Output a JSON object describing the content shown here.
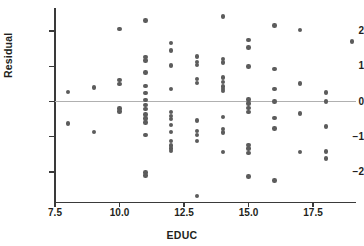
{
  "chart_data": {
    "type": "scatter",
    "title": "",
    "xlabel": "EDUC",
    "ylabel": "Residual",
    "xlim": [
      7.0,
      19.6
    ],
    "ylim": [
      -2.75,
      2.55
    ],
    "xticks": [
      7.5,
      10.0,
      12.5,
      15.0,
      17.5
    ],
    "xtick_labels": [
      "7.5",
      "10.0",
      "12.5",
      "15.0",
      "17.5"
    ],
    "yticks": [
      2,
      1,
      0,
      -1,
      -2
    ],
    "ytick_labels": [
      "2",
      "1",
      "0",
      "−1",
      "−2"
    ],
    "grid": false,
    "legend": null,
    "reference_line": {
      "type": "horizontal",
      "y": 0,
      "color": "#b0b0b0"
    },
    "marker": {
      "shape": "circle",
      "color": "#5c5c5c",
      "size": 4.4
    },
    "points": [
      {
        "x": 8,
        "y": 0.27
      },
      {
        "x": 8,
        "y": -0.63
      },
      {
        "x": 9,
        "y": 0.4
      },
      {
        "x": 9,
        "y": -0.86
      },
      {
        "x": 10,
        "y": 2.06
      },
      {
        "x": 10,
        "y": 0.61
      },
      {
        "x": 10,
        "y": 0.5
      },
      {
        "x": 10,
        "y": -0.2
      },
      {
        "x": 10,
        "y": -0.28
      },
      {
        "x": 11,
        "y": 2.3
      },
      {
        "x": 11,
        "y": 1.26
      },
      {
        "x": 11,
        "y": 1.16
      },
      {
        "x": 11,
        "y": 0.82
      },
      {
        "x": 11,
        "y": 0.44
      },
      {
        "x": 11,
        "y": 0.25
      },
      {
        "x": 11,
        "y": 0.05
      },
      {
        "x": 11,
        "y": -0.1
      },
      {
        "x": 11,
        "y": -0.22
      },
      {
        "x": 11,
        "y": -0.37
      },
      {
        "x": 11,
        "y": -0.48
      },
      {
        "x": 11,
        "y": -0.6
      },
      {
        "x": 11,
        "y": -0.95
      },
      {
        "x": 11,
        "y": -2.02
      },
      {
        "x": 11,
        "y": -2.1
      },
      {
        "x": 12,
        "y": 1.66
      },
      {
        "x": 12,
        "y": 1.45
      },
      {
        "x": 12,
        "y": 1.02
      },
      {
        "x": 12,
        "y": 0.35
      },
      {
        "x": 12,
        "y": -0.3
      },
      {
        "x": 12,
        "y": -0.42
      },
      {
        "x": 12,
        "y": -0.49
      },
      {
        "x": 12,
        "y": -0.67
      },
      {
        "x": 12,
        "y": -0.87
      },
      {
        "x": 12,
        "y": -1.12
      },
      {
        "x": 12,
        "y": -1.25
      },
      {
        "x": 12,
        "y": -1.33
      },
      {
        "x": 12,
        "y": -1.4
      },
      {
        "x": 13,
        "y": 1.28
      },
      {
        "x": 13,
        "y": 1.12
      },
      {
        "x": 13,
        "y": 1.03
      },
      {
        "x": 13,
        "y": 0.64
      },
      {
        "x": 13,
        "y": 0.53
      },
      {
        "x": 13,
        "y": -0.54
      },
      {
        "x": 13,
        "y": -0.84
      },
      {
        "x": 13,
        "y": -0.95
      },
      {
        "x": 13,
        "y": -1.12
      },
      {
        "x": 13,
        "y": -2.68
      },
      {
        "x": 14,
        "y": 2.42
      },
      {
        "x": 14,
        "y": 1.2
      },
      {
        "x": 14,
        "y": 1.11
      },
      {
        "x": 14,
        "y": 0.68
      },
      {
        "x": 14,
        "y": 0.56
      },
      {
        "x": 14,
        "y": 0.43
      },
      {
        "x": 14,
        "y": 0.35
      },
      {
        "x": 14,
        "y": 0.29
      },
      {
        "x": 14,
        "y": -0.44
      },
      {
        "x": 14,
        "y": -0.78
      },
      {
        "x": 14,
        "y": -0.88
      },
      {
        "x": 14,
        "y": -1.44
      },
      {
        "x": 15,
        "y": 1.75
      },
      {
        "x": 15,
        "y": 1.53
      },
      {
        "x": 15,
        "y": 0.99
      },
      {
        "x": 15,
        "y": 0.06
      },
      {
        "x": 15,
        "y": -0.06
      },
      {
        "x": 15,
        "y": -0.18
      },
      {
        "x": 15,
        "y": -0.3
      },
      {
        "x": 15,
        "y": -1.23
      },
      {
        "x": 15,
        "y": -1.33
      },
      {
        "x": 15,
        "y": -1.47
      },
      {
        "x": 15,
        "y": -2.13
      },
      {
        "x": 16,
        "y": 2.16
      },
      {
        "x": 16,
        "y": 0.92
      },
      {
        "x": 16,
        "y": 0.35
      },
      {
        "x": 16,
        "y": 0.0
      },
      {
        "x": 16,
        "y": -0.47
      },
      {
        "x": 16,
        "y": -0.77
      },
      {
        "x": 16,
        "y": -2.24
      },
      {
        "x": 17,
        "y": 2.04
      },
      {
        "x": 17,
        "y": 0.51
      },
      {
        "x": 17,
        "y": -0.34
      },
      {
        "x": 17,
        "y": -1.44
      },
      {
        "x": 18,
        "y": 0.26
      },
      {
        "x": 18,
        "y": 0.0
      },
      {
        "x": 18,
        "y": -0.71
      },
      {
        "x": 18,
        "y": -1.42
      },
      {
        "x": 18,
        "y": -1.62
      },
      {
        "x": 19,
        "y": 1.7
      }
    ]
  },
  "axes": {
    "x_title": "EDUC",
    "y_title": "Residual",
    "x_labels": [
      "7.5",
      "10.0",
      "12.5",
      "15.0",
      "17.5"
    ],
    "y_labels": [
      "2",
      "1",
      "0",
      "−1",
      "−2"
    ]
  },
  "colors": {
    "marker": "#5c5c5c",
    "axis": "#3a3a3a",
    "reference_line": "#b0b0b0",
    "text": "#231f20",
    "background": "#ffffff"
  }
}
